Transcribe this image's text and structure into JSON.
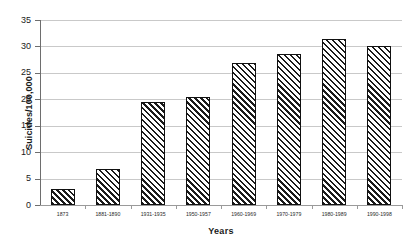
{
  "chart_data": {
    "type": "bar",
    "title": "",
    "xlabel": "Years",
    "ylabel": "Suicides/100,000",
    "categories": [
      "1873",
      "1881-1890",
      "1931-1935",
      "1950-1957",
      "1960-1969",
      "1970-1979",
      "1980-1989",
      "1990-1998"
    ],
    "values": [
      3.0,
      6.8,
      19.4,
      20.4,
      26.8,
      28.6,
      31.5,
      30.0
    ],
    "ylim": [
      0,
      35
    ],
    "ytick_labels": [
      "0",
      "5",
      "10",
      "15",
      "20",
      "25",
      "30",
      "35"
    ],
    "ytick_values": [
      0,
      5,
      10,
      15,
      20,
      25,
      30,
      35
    ],
    "ytick_step": 5,
    "grid": true,
    "legend": false,
    "bar_fill": "diagonal-hatch",
    "bar_border_color": "#111111",
    "gridline_color": "#c9c9c9",
    "axis_color": "#6e6e6e",
    "background_color": "#ffffff"
  }
}
